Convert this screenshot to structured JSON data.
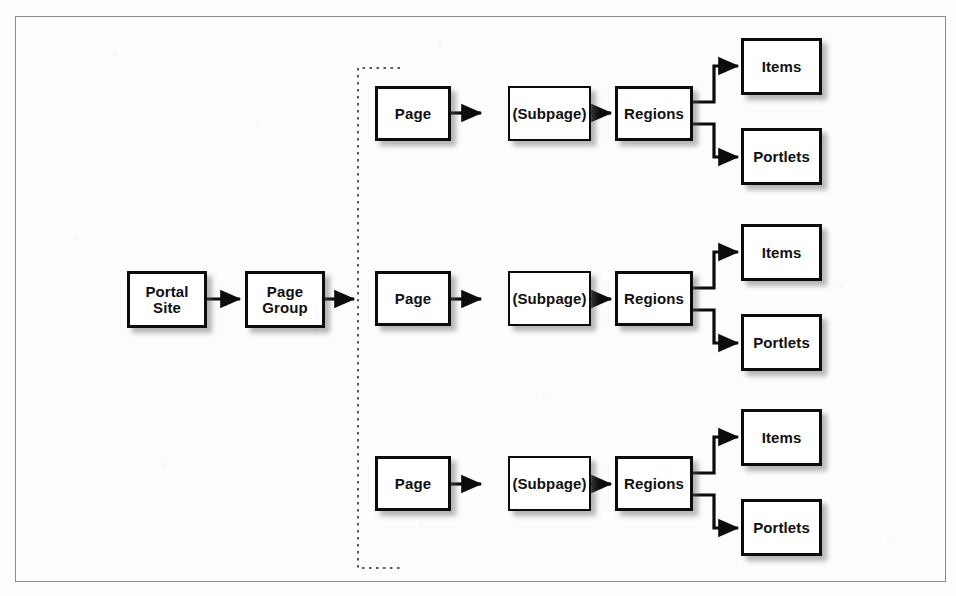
{
  "figure": {
    "type": "flow-diagram",
    "title": "",
    "colors": {
      "page_background": "#fdfdfd",
      "node_fill": "#ffffff",
      "node_border": "#0c0c0c",
      "connector": "#0c0c0c",
      "frame_border": "#8d8d8d",
      "shadow": "#5a5a5a",
      "group_bracket": "#555555"
    },
    "frame": {
      "border_style": "solid-thin"
    },
    "group_bracket": {
      "style": "dotted",
      "shape": "left-bracket"
    }
  },
  "nodes": {
    "portal_site": {
      "label": "Portal\nSite",
      "line1": "Portal",
      "line2": "Site"
    },
    "page_group": {
      "label": "Page\nGroup",
      "line1": "Page",
      "line2": "Group"
    },
    "page": {
      "label": "Page"
    },
    "subpage": {
      "label": "(Subpage)"
    },
    "regions": {
      "label": "Regions"
    },
    "items": {
      "label": "Items"
    },
    "portlets": {
      "label": "Portlets"
    }
  },
  "rows": [
    {
      "index": 1,
      "page": "Page",
      "subpage": "(Subpage)",
      "regions": "Regions",
      "leaves": [
        "Items",
        "Portlets"
      ]
    },
    {
      "index": 2,
      "page": "Page",
      "subpage": "(Subpage)",
      "regions": "Regions",
      "leaves": [
        "Items",
        "Portlets"
      ]
    },
    {
      "index": 3,
      "page": "Page",
      "subpage": "(Subpage)",
      "regions": "Regions",
      "leaves": [
        "Items",
        "Portlets"
      ]
    }
  ],
  "edges": [
    {
      "from": "Portal Site",
      "to": "Page Group"
    },
    {
      "from": "Page Group",
      "to": "Page Group Set"
    },
    {
      "from": "Page",
      "to": "(Subpage)"
    },
    {
      "from": "(Subpage)",
      "to": "Regions"
    },
    {
      "from": "Regions",
      "to": "Items"
    },
    {
      "from": "Regions",
      "to": "Portlets"
    }
  ]
}
